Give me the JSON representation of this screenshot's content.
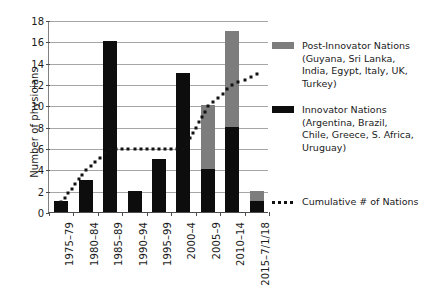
{
  "chart_data": {
    "type": "bar",
    "title": "",
    "xlabel": "",
    "ylabel": "Number of physicians",
    "ylim": [
      0,
      18
    ],
    "ytick_step": 2,
    "yticks": [
      0,
      2,
      4,
      6,
      8,
      10,
      12,
      14,
      16,
      18
    ],
    "grid": true,
    "legend_position": "right",
    "stacked": true,
    "categories": [
      "1975–79",
      "1980–84",
      "1985–89",
      "1990–94",
      "1995–99",
      "2000–4",
      "2005–9",
      "2010–14",
      "2015–7/1/18"
    ],
    "series": [
      {
        "name": "Innovator Nations",
        "color": "#0d0d0d",
        "values": [
          1,
          3,
          16,
          2,
          5,
          13,
          4,
          8,
          1
        ]
      },
      {
        "name": "Post-Innovator Nations",
        "color": "#7d7d7d",
        "values": [
          0,
          0,
          0,
          0,
          0,
          0,
          6,
          9,
          1
        ]
      },
      {
        "name": "Cumulative # of Nations",
        "type": "line",
        "style": "dotted",
        "color": "#111111",
        "values": [
          1,
          4,
          6,
          6,
          6,
          6,
          10,
          12,
          13
        ]
      }
    ],
    "bar_totals": [
      1,
      3,
      16,
      2,
      5,
      13,
      10,
      17,
      2
    ]
  },
  "axes": {
    "y_title": "Number of physicians",
    "y_tick_labels": [
      "18",
      "16",
      "14",
      "12",
      "10",
      "8",
      "6",
      "4",
      "2",
      "0"
    ],
    "x_tick_labels": [
      "1975–79",
      "1980–84",
      "1985–89",
      "1990–94",
      "1995–99",
      "2000–4",
      "2005–9",
      "2010–14",
      "2015–7/1/18"
    ]
  },
  "legend": {
    "entries": [
      {
        "marker": "swatch-gray",
        "lines": [
          "Post-Innovator Nations",
          "(Guyana, Sri Lanka,",
          "India, Egypt, Italy, UK,",
          "Turkey)"
        ]
      },
      {
        "marker": "swatch-black",
        "lines": [
          "Innovator Nations",
          "(Argentina, Brazil,",
          "Chile, Greece, S. Africa,",
          "Uruguay)"
        ]
      }
    ],
    "cumulative": {
      "marker": "dotted-line",
      "label": "Cumulative # of Nations"
    }
  },
  "colors": {
    "innovator": "#0d0d0d",
    "post_innovator": "#7d7d7d",
    "cumulative": "#111111",
    "gridline": "#a6a6a6",
    "axis": "#4d4d4d"
  }
}
